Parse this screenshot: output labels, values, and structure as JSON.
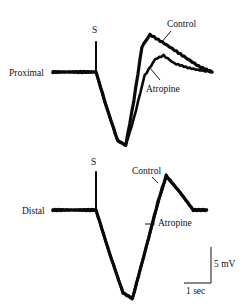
{
  "chart_data": {
    "type": "line",
    "title": "",
    "panels": [
      {
        "name": "Proximal",
        "stimulus_label": "S",
        "series": [
          {
            "name": "Control",
            "t_sec": [
              -1.6,
              -0.8,
              0.0,
              0.4,
              0.8,
              1.1,
              1.4,
              1.7,
              2.0,
              2.6,
              3.2,
              3.8,
              4.3
            ],
            "mV": [
              0,
              0,
              0,
              -5,
              -9.5,
              -10.2,
              -4,
              3.5,
              5.2,
              3.8,
              2.3,
              0.8,
              0
            ]
          },
          {
            "name": "Atropine",
            "t_sec": [
              -1.6,
              -0.8,
              0.0,
              0.4,
              0.8,
              1.1,
              1.4,
              1.8,
              2.2,
              2.5,
              2.9,
              3.4,
              3.9,
              4.3
            ],
            "mV": [
              0,
              0,
              0,
              -5,
              -9.5,
              -10.2,
              -6.5,
              -0.5,
              1.8,
              2.3,
              1.2,
              0.6,
              0.2,
              0
            ]
          }
        ]
      },
      {
        "name": "Distal",
        "stimulus_label": "S",
        "series": [
          {
            "name": "Control",
            "t_sec": [
              -1.6,
              -0.8,
              0.0,
              0.5,
              1.0,
              1.35,
              1.8,
              2.3,
              2.6,
              3.1,
              3.6,
              4.1
            ],
            "mV": [
              0,
              0,
              0,
              -6,
              -11.5,
              -12.3,
              -6,
              1.2,
              4.8,
              2.5,
              0,
              0
            ]
          },
          {
            "name": "Atropine",
            "t_sec": [
              -1.6,
              -0.8,
              0.0,
              0.5,
              1.0,
              1.35,
              1.8,
              2.3,
              2.6,
              3.1,
              3.6,
              4.1
            ],
            "mV": [
              0,
              0,
              0,
              -6,
              -11.5,
              -12.3,
              -6,
              1.0,
              4.6,
              2.5,
              0,
              0
            ]
          }
        ]
      }
    ],
    "scale_bar": {
      "voltage_label": "5 mV",
      "voltage_mV": 5,
      "time_label": "1 sec",
      "time_sec": 1
    },
    "xlabel": "",
    "ylabel": "",
    "grid": false
  },
  "labels": {
    "proximal": "Proximal",
    "distal": "Distal",
    "stim": "S",
    "control": "Control",
    "atropine": "Atropine",
    "scale_v": "5 mV",
    "scale_t": "1 sec"
  }
}
